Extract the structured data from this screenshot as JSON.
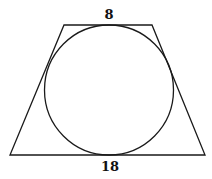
{
  "diagram": {
    "type": "trapezoid-with-inscribed-circle",
    "top_base_label": "8",
    "bottom_base_label": "18",
    "stroke_color": "#1a1a1a",
    "background": "#ffffff"
  }
}
